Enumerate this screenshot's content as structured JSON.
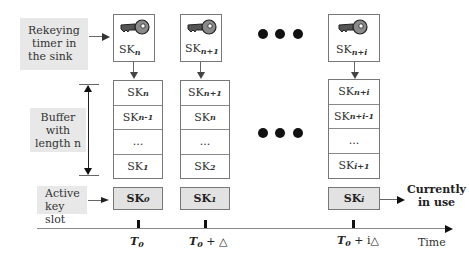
{
  "labels": {
    "rekeying_timer": "Rekeying timer in the sink",
    "rekeying_timer_lines": [
      "Rekeying",
      "timer in",
      "the sink"
    ],
    "buffer_lines": [
      "Buffer",
      "with",
      "length n"
    ],
    "active_slot_lines": [
      "Active",
      "key slot"
    ],
    "currently_in_use_lines": [
      "Currently",
      "in use"
    ],
    "time_axis": "Time"
  },
  "columns": [
    {
      "key_label": {
        "base": "SK",
        "sub": "n"
      },
      "buffer": [
        {
          "base": "SK",
          "sub": "n"
        },
        {
          "base": "SK",
          "sub": "n-1"
        },
        {
          "base": "...",
          "sub": ""
        },
        {
          "base": "SK",
          "sub": "1"
        }
      ],
      "active": {
        "base": "SK",
        "sub": "0"
      },
      "time": {
        "base": "T",
        "sub": "0",
        "suffix": ""
      }
    },
    {
      "key_label": {
        "base": "SK",
        "sub": "n+1"
      },
      "buffer": [
        {
          "base": "SK",
          "sub": "n+1"
        },
        {
          "base": "SK",
          "sub": "n"
        },
        {
          "base": "...",
          "sub": ""
        },
        {
          "base": "SK",
          "sub": "2"
        }
      ],
      "active": {
        "base": "SK",
        "sub": "1"
      },
      "time": {
        "base": "T",
        "sub": "0",
        "suffix": " + △"
      }
    },
    {
      "key_label": {
        "base": "SK",
        "sub": "n+i"
      },
      "buffer": [
        {
          "base": "SK",
          "sub": "n+i"
        },
        {
          "base": "SK",
          "sub": "n+i-1"
        },
        {
          "base": "...",
          "sub": ""
        },
        {
          "base": "SK",
          "sub": "i+1"
        }
      ],
      "active": {
        "base": "SK",
        "sub": "i"
      },
      "time": {
        "base": "T",
        "sub": "0",
        "suffix": " + i△"
      }
    }
  ],
  "ellipsis_dots": "● ● ●",
  "colors": {
    "label_bg": "#e8e8e8",
    "active_slot_bg": "#e2e2e2",
    "line": "#666666",
    "key_fill": "#8a8a8a"
  }
}
